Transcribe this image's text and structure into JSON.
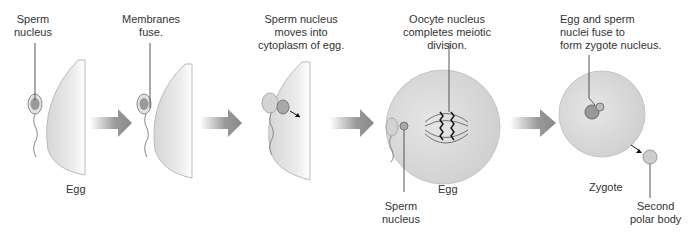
{
  "diagram": {
    "stages": [
      {
        "label_top": [
          "Sperm",
          "nucleus"
        ],
        "label_bottom": "Egg"
      },
      {
        "label_top": [
          "Membranes",
          "fuse."
        ]
      },
      {
        "label_top": [
          "Sperm nucleus",
          "moves into",
          "cytoplasm of egg."
        ]
      },
      {
        "label_top": [
          "Oocyte nucleus",
          "completes meiotic",
          "division."
        ],
        "label_bottom": "Egg",
        "label_sperm": [
          "Sperm",
          "nucleus"
        ]
      },
      {
        "label_top": [
          "Egg and sperm",
          "nuclei fuse to",
          "form zygote nucleus."
        ],
        "label_bottom": "Zygote",
        "label_polar": [
          "Second",
          "polar body"
        ]
      }
    ],
    "colors": {
      "cell": "#dcdcdc",
      "cell_edge": "#bdbdbd",
      "arrow": "#8a8a8a",
      "nucleus": "#9a9a9a",
      "line": "#555555"
    }
  }
}
